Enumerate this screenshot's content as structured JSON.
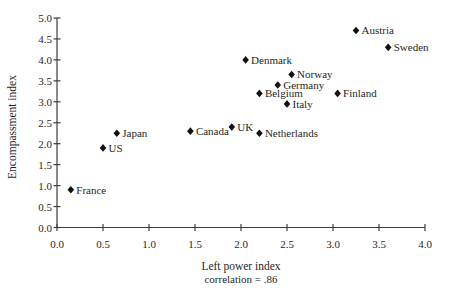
{
  "figure": {
    "background": "#ffffff",
    "text_color": "#1f1f1f",
    "axis_color": "#3c3c3c",
    "marker_color": "#111111"
  },
  "chart_data": {
    "type": "scatter",
    "title": "",
    "xlabel": "Left power index",
    "ylabel": "Encompassment index",
    "caption": "correlation = .86",
    "xlim": [
      0.0,
      4.0
    ],
    "ylim": [
      0.0,
      5.0
    ],
    "x_tick_step": 0.5,
    "y_tick_step": 0.5,
    "x_ticks": [
      "0.0",
      "0.5",
      "1.0",
      "1.5",
      "2.0",
      "2.5",
      "3.0",
      "3.5",
      "4.0"
    ],
    "y_ticks": [
      "0.0",
      "0.5",
      "1.0",
      "1.5",
      "2.0",
      "2.5",
      "3.0",
      "3.5",
      "4.0",
      "4.5",
      "5.0"
    ],
    "grid": false,
    "legend": false,
    "marker": "filled-diamond",
    "tick_style": "cross",
    "points": [
      {
        "label": "France",
        "x": 0.15,
        "y": 0.9
      },
      {
        "label": "US",
        "x": 0.5,
        "y": 1.9
      },
      {
        "label": "Japan",
        "x": 0.65,
        "y": 2.25
      },
      {
        "label": "Canada",
        "x": 1.45,
        "y": 2.3
      },
      {
        "label": "UK",
        "x": 1.9,
        "y": 2.4
      },
      {
        "label": "Denmark",
        "x": 2.05,
        "y": 4.0
      },
      {
        "label": "Netherlands",
        "x": 2.2,
        "y": 2.25
      },
      {
        "label": "Belgium",
        "x": 2.2,
        "y": 3.2
      },
      {
        "label": "Germany",
        "x": 2.4,
        "y": 3.4
      },
      {
        "label": "Italy",
        "x": 2.5,
        "y": 2.95
      },
      {
        "label": "Norway",
        "x": 2.55,
        "y": 3.65
      },
      {
        "label": "Finland",
        "x": 3.05,
        "y": 3.2
      },
      {
        "label": "Austria",
        "x": 3.25,
        "y": 4.7
      },
      {
        "label": "Sweden",
        "x": 3.6,
        "y": 4.3
      }
    ]
  }
}
